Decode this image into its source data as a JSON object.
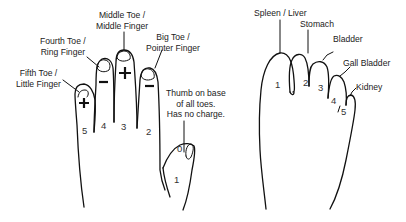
{
  "hand": {
    "labels": {
      "middle": [
        "Middle Toe /",
        "Middle Finger"
      ],
      "fourth": [
        "Fourth Toe /",
        "Ring Finger"
      ],
      "big": [
        "Big Toe /",
        "Pointer Finger"
      ],
      "fifth": [
        "Fifth Toe /",
        "Little Finger"
      ],
      "thumb": [
        "Thumb on base",
        "of all toes.",
        "Has no charge."
      ]
    },
    "numbers": {
      "little": "5",
      "ring": "4",
      "middle": "3",
      "pointer": "2",
      "thumb_base": "1",
      "thumb_tip": "0"
    },
    "charges": {
      "little": "+",
      "ring": "−",
      "middle": "+",
      "pointer": "−"
    }
  },
  "foot": {
    "labels": {
      "toe1": "Spleen / Liver",
      "toe2": "Stomach",
      "toe3": "Bladder",
      "toe4": "Gall Bladder",
      "toe5": "Kidney"
    },
    "numbers": {
      "toe1": "1",
      "toe2": "2",
      "toe3": "3",
      "toe4": "4",
      "toe5": "5"
    }
  }
}
